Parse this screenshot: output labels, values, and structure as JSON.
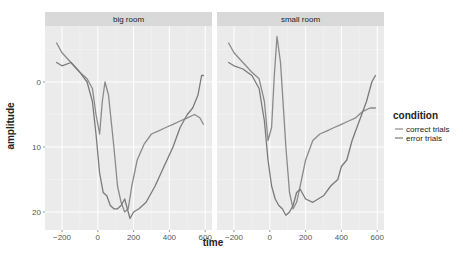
{
  "chart_data": {
    "type": "line",
    "title": "",
    "xlabel": "time",
    "ylabel": "amplitude",
    "y_reversed": true,
    "xlim": [
      -250,
      620
    ],
    "ylim": [
      -8,
      22
    ],
    "x_ticks": [
      -200,
      0,
      200,
      400,
      600
    ],
    "y_ticks": [
      0,
      10,
      20
    ],
    "grid": true,
    "legend": {
      "title": "condition",
      "position": "right",
      "entries": [
        "correct trials",
        "error trials"
      ]
    },
    "facets": [
      {
        "label": "big room",
        "series": [
          {
            "name": "correct trials",
            "x": [
              -230,
              -200,
              -150,
              -100,
              -60,
              -30,
              -10,
              10,
              25,
              40,
              60,
              90,
              110,
              130,
              150,
              170,
              190,
              220,
              260,
              300,
              340,
              380,
              420,
              460,
              500,
              540,
              570,
              590
            ],
            "y": [
              -6,
              -4.5,
              -3,
              -1.5,
              -0.5,
              1,
              5,
              8,
              3,
              0,
              2,
              10,
              16,
              18.5,
              20,
              19.5,
              16,
              12,
              9.5,
              8,
              7.5,
              7,
              6.5,
              6,
              5.5,
              5,
              5.5,
              6.5
            ]
          },
          {
            "name": "error trials",
            "x": [
              -230,
              -200,
              -150,
              -100,
              -60,
              -30,
              -10,
              10,
              30,
              50,
              70,
              90,
              110,
              130,
              150,
              170,
              180,
              200,
              230,
              270,
              320,
              370,
              420,
              460,
              500,
              530,
              560,
              580,
              590
            ],
            "y": [
              -3,
              -2.5,
              -3,
              -1.5,
              0,
              3,
              8,
              14,
              17,
              17.5,
              19,
              19.5,
              19.5,
              19,
              18,
              20,
              21,
              20,
              19.5,
              18.5,
              16,
              13,
              10,
              7,
              5,
              4,
              2,
              -1,
              -1
            ]
          }
        ]
      },
      {
        "label": "small room",
        "series": [
          {
            "name": "correct trials",
            "x": [
              -230,
              -200,
              -150,
              -100,
              -60,
              -30,
              -10,
              10,
              25,
              40,
              60,
              90,
              110,
              130,
              150,
              170,
              200,
              240,
              280,
              320,
              360,
              400,
              440,
              480,
              520,
              560,
              590
            ],
            "y": [
              -6,
              -4.5,
              -3,
              -1.5,
              -0.5,
              3,
              9,
              7,
              -1,
              -7,
              -3,
              10,
              17,
              19.5,
              18.5,
              16,
              12,
              9,
              8,
              7.5,
              7,
              6.5,
              6,
              5.5,
              4.5,
              4,
              4
            ]
          },
          {
            "name": "error trials",
            "x": [
              -230,
              -200,
              -150,
              -100,
              -60,
              -30,
              -10,
              10,
              30,
              50,
              70,
              90,
              110,
              130,
              150,
              170,
              200,
              240,
              270,
              300,
              340,
              380,
              400,
              430,
              460,
              500,
              540,
              570,
              590
            ],
            "y": [
              -3,
              -2.5,
              -2,
              -1,
              1,
              6,
              12,
              16,
              18,
              19,
              19.5,
              20.5,
              20,
              19,
              17,
              16.5,
              18,
              18.5,
              18,
              17.5,
              16,
              15,
              13,
              12,
              9,
              6,
              3,
              0,
              -1
            ]
          }
        ]
      }
    ]
  },
  "colors": {
    "panel_bg": "#ebebeb",
    "strip_bg": "#d9d9d9",
    "grid_major": "#ffffff",
    "grid_minor": "#f4f4f4",
    "correct_line": "#8a8a8a",
    "error_line": "#7a7a7a"
  }
}
